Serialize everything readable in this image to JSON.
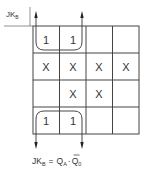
{
  "kmap": {
    "corner_label": {
      "main": "JK",
      "sub": "B"
    },
    "grid": [
      [
        "1",
        "1",
        "",
        ""
      ],
      [
        "X",
        "X",
        "X",
        "X"
      ],
      [
        "",
        "X",
        "X",
        ""
      ],
      [
        "1",
        "1",
        "",
        ""
      ]
    ],
    "groups": [
      {
        "name": "top-pair-loop",
        "cells": [
          [
            0,
            0
          ],
          [
            0,
            1
          ]
        ]
      },
      {
        "name": "bottom-pair-loop",
        "cells": [
          [
            3,
            0
          ],
          [
            3,
            1
          ]
        ]
      }
    ]
  },
  "equation": {
    "lhs_main": "JK",
    "lhs_sub": "B",
    "equals": "=",
    "t1_main": "Q",
    "t1_sub": "A",
    "dot": "·",
    "t2_main": "Q",
    "t2_sub": "0"
  },
  "colors": {
    "line": "#444444",
    "text": "#333333"
  }
}
